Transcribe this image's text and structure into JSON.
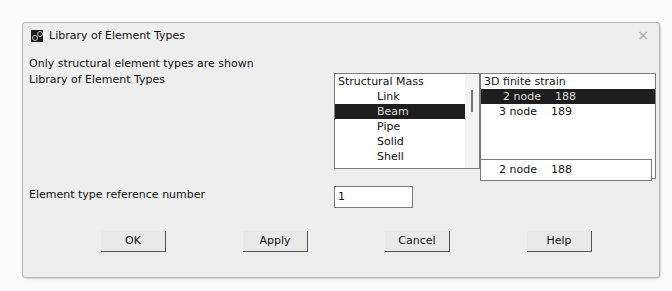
{
  "window": {
    "title": "Library of Element Types",
    "icon": "app-icon",
    "close": "×"
  },
  "info_text": "Only structural element types are shown",
  "library_label": "Library of Element Types",
  "category_list": {
    "items": [
      {
        "label": "Structural Mass",
        "indent": false,
        "selected": false
      },
      {
        "label": "Link",
        "indent": true,
        "selected": false
      },
      {
        "label": "Beam",
        "indent": true,
        "selected": true
      },
      {
        "label": "Pipe",
        "indent": true,
        "selected": false
      },
      {
        "label": "Solid",
        "indent": true,
        "selected": false
      },
      {
        "label": "Shell",
        "indent": true,
        "selected": false
      }
    ]
  },
  "type_list": {
    "header": "3D finite strain",
    "items": [
      {
        "node": "2 node",
        "num": "188",
        "selected": true
      },
      {
        "node": "3 node",
        "num": "189",
        "selected": false
      }
    ]
  },
  "selection_field": {
    "node": "2 node",
    "num": "188"
  },
  "ref_number": {
    "label": "Element type reference number",
    "value": "1"
  },
  "buttons": {
    "ok": "OK",
    "apply": "Apply",
    "cancel": "Cancel",
    "help": "Help"
  }
}
